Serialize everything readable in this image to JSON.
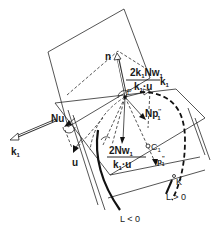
{
  "figure": {
    "labels": {
      "n": "n",
      "Nu": "Nu",
      "k1": "k",
      "k1_sub": "1",
      "u": "u",
      "P": "P",
      "Np": "Np",
      "Np_sup": "''",
      "Np_sub": "1",
      "frac_top_num": "2k",
      "frac_top_num_sub": "1",
      "frac_top_num_rest": "Nw",
      "frac_top_num_rest_sub": "1",
      "frac_top_den": "k",
      "frac_top_den_sub": "1",
      "frac_top_den_rest": "·u",
      "frac_top_suffix": "k",
      "frac_top_suffix_sub": "1",
      "frac_bot_num": "2Nw",
      "frac_bot_num_sub": "1",
      "frac_bot_den": "k",
      "frac_bot_den_sub": "1",
      "frac_bot_den_rest": "·u",
      "C1": "C",
      "C1_sub": "1",
      "p1": "p",
      "p1_sup": "''",
      "p1_sub": "1",
      "K": "K",
      "L_pos": "L > 0",
      "L_neg": "L < 0"
    },
    "colors": {
      "line": "#2a2a2a",
      "background": "#ffffff"
    }
  }
}
